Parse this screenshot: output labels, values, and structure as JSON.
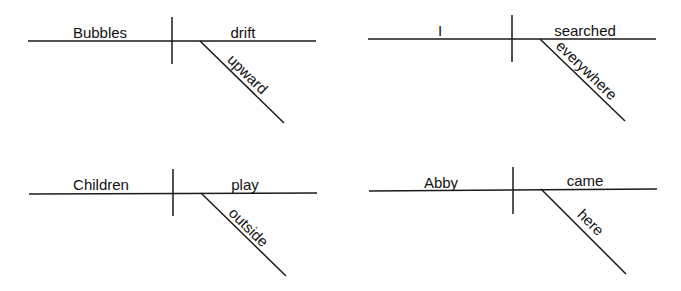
{
  "diagrams": [
    {
      "subject": "Bubbles",
      "verb": "drift",
      "modifier": "upward"
    },
    {
      "subject": "I",
      "verb": "searched",
      "modifier": "everywhere"
    },
    {
      "subject": "Children",
      "verb": "play",
      "modifier": "outside"
    },
    {
      "subject": "Abby",
      "verb": "came",
      "modifier": "here"
    }
  ]
}
